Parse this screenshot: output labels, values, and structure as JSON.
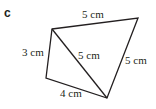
{
  "part_label": "c",
  "colors": {
    "stroke": "#231f20",
    "background": "#ffffff"
  },
  "shape": {
    "type": "quadrilateral-with-diagonal",
    "vertices": {
      "A": [
        52,
        29
      ],
      "B": [
        138,
        18
      ],
      "C": [
        46,
        78
      ],
      "D": [
        107,
        98
      ]
    },
    "edges": [
      {
        "from": "A",
        "to": "B",
        "label": "5 cm"
      },
      {
        "from": "B",
        "to": "D",
        "label": "5 cm"
      },
      {
        "from": "A",
        "to": "D",
        "label": "5 cm"
      },
      {
        "from": "A",
        "to": "C",
        "label": "3 cm"
      },
      {
        "from": "C",
        "to": "D",
        "label": "4 cm"
      }
    ]
  }
}
